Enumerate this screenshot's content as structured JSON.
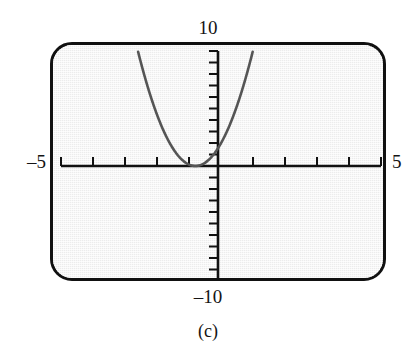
{
  "figure": {
    "caption": "(c)",
    "labels": {
      "top": "10",
      "bottom": "–10",
      "left": "–5",
      "right": "5"
    },
    "colors": {
      "screen_background": "#ececec",
      "frame": "#111111",
      "axis": "#111111",
      "curve": "#555555",
      "text": "#141414"
    }
  },
  "chart_data": {
    "type": "line",
    "title": "",
    "subtitle": "",
    "xlabel": "",
    "ylabel": "",
    "grid": false,
    "legend": null,
    "xlim": [
      -5,
      5
    ],
    "ylim": [
      -10,
      10
    ],
    "xtick_step": 1,
    "ytick_step": 1,
    "xticks": [
      -5,
      -4,
      -3,
      -2,
      -1,
      1,
      2,
      3,
      4,
      5
    ],
    "yticks": [
      -10,
      -9,
      -8,
      -7,
      -6,
      -5,
      -4,
      -3,
      -2,
      -1,
      1,
      2,
      3,
      4,
      5,
      6,
      7,
      8,
      9,
      10
    ],
    "axis_end_labels": {
      "x_min": "–5",
      "x_max": "5",
      "y_min": "–10",
      "y_max": "10"
    },
    "annotations": [
      "(c)"
    ],
    "series": [
      {
        "name": "parabola",
        "kind": "quadratic",
        "description": "Upward-opening parabola with vertex on the x-axis, left of the y-axis",
        "vertex": [
          -0.8,
          0.0
        ],
        "y_intercept": 2.0,
        "leading_coefficient": 3.1,
        "x": [
          -2.6,
          -2.4,
          -2.2,
          -2.0,
          -1.8,
          -1.6,
          -1.4,
          -1.2,
          -1.0,
          -0.8,
          -0.6,
          -0.4,
          -0.2,
          0.0,
          0.2,
          0.4,
          0.6,
          0.8,
          1.0,
          1.2,
          1.4
        ],
        "y": [
          10.0,
          7.9,
          6.1,
          4.5,
          3.1,
          2.0,
          1.1,
          0.5,
          0.12,
          0.0,
          0.12,
          0.5,
          1.1,
          2.0,
          3.1,
          4.5,
          6.1,
          7.9,
          10.0,
          12.4,
          14.9
        ]
      }
    ]
  }
}
